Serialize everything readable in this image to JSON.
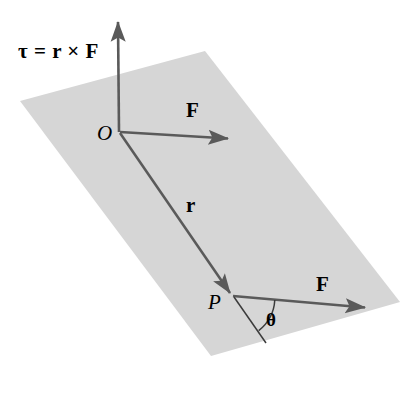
{
  "figure": {
    "background_color": "#ffffff",
    "plane_fill_color": "#d6d6d6",
    "vector_color": "#5a5a5a",
    "label_color": "#000000"
  },
  "labels": {
    "equation": "τ = r × F",
    "origin": "O",
    "force_top": "F",
    "radius": "r",
    "point_p": "P",
    "force_bottom": "F",
    "theta": "θ"
  },
  "geometry": {
    "plane_polygon": "20,101 205,51 400,302 211,356",
    "torque_axis": {
      "x1": 119,
      "y1": 132,
      "x2": 118,
      "y2": 22
    },
    "force_top_vector": {
      "x1": 120,
      "y1": 132,
      "x2": 230,
      "y2": 139
    },
    "radius_vector": {
      "x1": 120,
      "y1": 133,
      "x2": 231,
      "y2": 294
    },
    "force_bottom_vector": {
      "x1": 233,
      "y1": 296,
      "x2": 367,
      "y2": 308
    },
    "radius_extension_line": {
      "x1": 234,
      "y1": 297,
      "x2": 266,
      "y2": 342
    },
    "theta_arc": {
      "cx": 233,
      "cy": 296,
      "radius": 42
    }
  }
}
